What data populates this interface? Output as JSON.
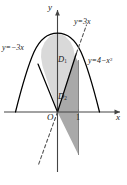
{
  "figure": {
    "name": "region-between-parabola-and-lines",
    "axes": {
      "x_axis_label": "x",
      "y_axis_label": "y",
      "origin_label": "O",
      "x_ticks": [
        "1"
      ]
    },
    "curves": [
      {
        "id": "parabola",
        "label": "y=4−x",
        "label_exponent": "2",
        "equation": "y = 4 - x^2",
        "style": "solid",
        "color": "#000000"
      },
      {
        "id": "line-neg3x",
        "label": "y=−3x",
        "equation": "y = -3x",
        "style": "solid",
        "color": "#000000"
      },
      {
        "id": "line-pos3x",
        "label": "y=3x",
        "equation": "y = 3x",
        "style": "dashed",
        "color": "#555555"
      }
    ],
    "regions": [
      {
        "id": "D1",
        "label": "D",
        "subscript": "1",
        "fill": "#d9d9d9"
      },
      {
        "id": "D2",
        "label": "D",
        "subscript": "2",
        "fill": "#a9a9a9"
      }
    ],
    "colors": {
      "background": "#ffffff",
      "stroke": "#000000",
      "dashed_stroke": "#555555",
      "region_light": "#d9d9d9",
      "region_dark": "#a9a9a9",
      "axis": "#444444"
    }
  }
}
